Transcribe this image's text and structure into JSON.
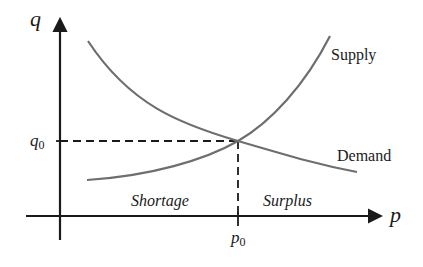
{
  "diagram": {
    "axes": {
      "y_label": "q",
      "x_label": "p"
    },
    "equilibrium": {
      "q_label": "q",
      "q_sub": "0",
      "p_label": "p",
      "p_sub": "0"
    },
    "curves": [
      {
        "name": "Supply",
        "label": "Supply",
        "color": "#6e6e6e"
      },
      {
        "name": "Demand",
        "label": "Demand",
        "color": "#6e6e6e"
      }
    ],
    "regions": {
      "left": "Shortage",
      "right": "Surplus"
    },
    "colors": {
      "axis": "#1a1a1a",
      "curve": "#6e6e6e",
      "dashed": "#1a1a1a",
      "background": "#ffffff"
    }
  }
}
